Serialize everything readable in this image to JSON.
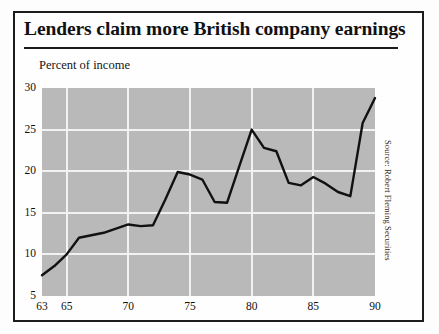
{
  "figure": {
    "title": "Lenders claim more British company earnings",
    "axis_caption": "Percent of income",
    "source": "Source: Robert Fleming Securities",
    "frame_color": "#1c1c1c",
    "plot_background": "#b9b9b9",
    "gridline_color": "#f2f2f2",
    "line_color": "#111111"
  },
  "chart_data": {
    "type": "line",
    "title": "Lenders claim more British company earnings",
    "subtitle": "",
    "xlabel": "",
    "ylabel": "Percent of income",
    "source": "Source: Robert Fleming Securities",
    "xlim": [
      63,
      90
    ],
    "ylim": [
      5,
      30
    ],
    "xticks": [
      63,
      65,
      70,
      75,
      80,
      85,
      90
    ],
    "xtick_labels": [
      "63",
      "65",
      "70",
      "75",
      "80",
      "85",
      "90"
    ],
    "yticks": [
      5,
      10,
      15,
      20,
      25,
      30
    ],
    "ytick_labels": [
      "5",
      "10",
      "15",
      "20",
      "25",
      "30"
    ],
    "grid": true,
    "grid_axis": "both",
    "legend": false,
    "legend_position": "none",
    "series": [
      {
        "name": "Percent of income",
        "x": [
          63,
          64,
          65,
          66,
          67,
          68,
          69,
          70,
          71,
          72,
          73,
          74,
          75,
          76,
          77,
          78,
          79,
          80,
          81,
          82,
          83,
          84,
          85,
          86,
          87,
          88,
          89,
          90
        ],
        "values": [
          7.5,
          8.6,
          10.0,
          12.0,
          12.3,
          12.6,
          13.1,
          13.6,
          13.4,
          13.5,
          16.6,
          19.9,
          19.6,
          19.0,
          16.3,
          16.2,
          20.6,
          25.0,
          22.8,
          22.4,
          18.6,
          18.3,
          19.3,
          18.5,
          17.5,
          17.0,
          25.8,
          28.8
        ]
      }
    ]
  }
}
